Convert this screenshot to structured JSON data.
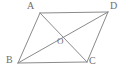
{
  "figure": {
    "name": "parallelogram-with-diagonals",
    "background_color": "#ffffff",
    "stroke_color": "#8a8a8a",
    "label_color": "#6e6e6e",
    "stroke_width": 1,
    "width": 127,
    "height": 74
  },
  "vertices": [
    {
      "id": "A",
      "label": "A",
      "x": 40,
      "y": 13,
      "label_x": 27,
      "label_y": 1
    },
    {
      "id": "D",
      "label": "D",
      "x": 108,
      "y": 12,
      "label_x": 110,
      "label_y": 1
    },
    {
      "id": "B",
      "label": "B",
      "x": 18,
      "y": 63,
      "label_x": 6,
      "label_y": 55
    },
    {
      "id": "C",
      "label": "C",
      "x": 87,
      "y": 62,
      "label_x": 89,
      "label_y": 56
    },
    {
      "id": "O",
      "label": "O",
      "x": 56,
      "y": 36,
      "label_x": 57,
      "label_y": 37
    }
  ],
  "edges": [
    {
      "name": "side-AD",
      "from": "A",
      "to": "D",
      "x1": 40,
      "y1": 13,
      "x2": 108,
      "y2": 12
    },
    {
      "name": "side-AB",
      "from": "A",
      "to": "B",
      "x1": 40,
      "y1": 13,
      "x2": 18,
      "y2": 63
    },
    {
      "name": "side-BC",
      "from": "B",
      "to": "C",
      "x1": 18,
      "y1": 63,
      "x2": 87,
      "y2": 62
    },
    {
      "name": "side-DC",
      "from": "D",
      "to": "C",
      "x1": 108,
      "y1": 12,
      "x2": 87,
      "y2": 62
    }
  ],
  "diagonals": [
    {
      "name": "diagonal-AC",
      "from": "A",
      "to": "C",
      "x1": 40,
      "y1": 13,
      "x2": 87,
      "y2": 62
    },
    {
      "name": "diagonal-BD",
      "from": "B",
      "to": "D",
      "x1": 18,
      "y1": 63,
      "x2": 108,
      "y2": 12
    }
  ]
}
